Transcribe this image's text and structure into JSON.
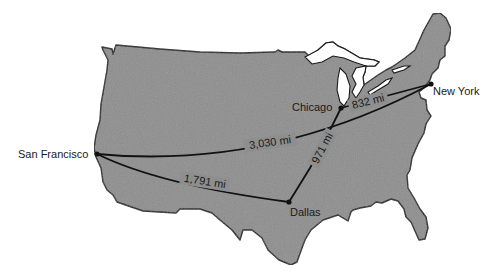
{
  "map": {
    "title": "",
    "land_color": "#8e8e8e",
    "outline_color": "#1a1a1a",
    "route_color": "#111111",
    "cities": [
      {
        "name": "San Francisco",
        "x": 97,
        "y": 154
      },
      {
        "name": "Chicago",
        "x": 341,
        "y": 108
      },
      {
        "name": "New York",
        "x": 431,
        "y": 84
      },
      {
        "name": "Dallas",
        "x": 289,
        "y": 202
      }
    ],
    "routes": [
      {
        "from": "San Francisco",
        "to": "New York",
        "label": "3,030 mi"
      },
      {
        "from": "San Francisco",
        "to": "Dallas",
        "label": "1,791 mi"
      },
      {
        "from": "Chicago",
        "to": "New York",
        "label": "832 mi"
      },
      {
        "from": "Chicago",
        "to": "Dallas",
        "label": "971 mi"
      }
    ]
  }
}
